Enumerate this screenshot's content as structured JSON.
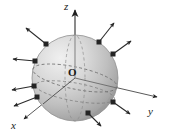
{
  "figure": {
    "background_color": "#ffffff",
    "width": 171,
    "height": 136
  },
  "axes": {
    "z": {
      "label": "z",
      "direction": "up",
      "tip": [
        75,
        7
      ],
      "origin": [
        75,
        78
      ]
    },
    "y": {
      "label": "y",
      "direction": "right",
      "tip": [
        159,
        98
      ],
      "origin": [
        75,
        78
      ]
    },
    "x": {
      "label": "x",
      "direction": "down-left-front",
      "tip": [
        22,
        121
      ],
      "origin": [
        75,
        78
      ]
    },
    "line_color": "#3a3a3a"
  },
  "origin": {
    "label": "O",
    "position": [
      75,
      78
    ]
  },
  "sphere": {
    "center": [
      75,
      78
    ],
    "radius": 43,
    "fill_light": "#e6e6e6",
    "fill_mid": "#c9c9c9",
    "fill_dark": "#9a9a9a",
    "outline_color": "#8a8a8a",
    "equator_style": "dashed",
    "meridian_style": "dashed"
  },
  "vectors": {
    "count": 8,
    "dot_color": "#262626",
    "shaft_color": "#2b2b2b",
    "description": "outward unit normal vectors at points on the sphere surface",
    "items": [
      {
        "id": "n1",
        "base": [
          46,
          44
        ],
        "tip": [
          24,
          26
        ]
      },
      {
        "id": "n2",
        "base": [
          99,
          42
        ],
        "tip": [
          116,
          21
        ]
      },
      {
        "id": "n3",
        "base": [
          113,
          52
        ],
        "tip": [
          133,
          39
        ]
      },
      {
        "id": "n4",
        "base": [
          35,
          61
        ],
        "tip": [
          11,
          59
        ]
      },
      {
        "id": "n5",
        "base": [
          34,
          86
        ],
        "tip": [
          10,
          91
        ]
      },
      {
        "id": "n6",
        "base": [
          36,
          97
        ],
        "tip": [
          12,
          108
        ]
      },
      {
        "id": "n7",
        "base": [
          113,
          102
        ],
        "tip": [
          132,
          116
        ]
      },
      {
        "id": "n8",
        "base": [
          88,
          113
        ],
        "tip": [
          103,
          128
        ]
      }
    ]
  }
}
